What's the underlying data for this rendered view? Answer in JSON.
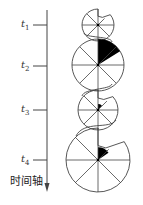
{
  "axis": {
    "title": "时间轴",
    "ticks": [
      {
        "symbol": "t",
        "sub": "1",
        "y": 25
      },
      {
        "symbol": "t",
        "sub": "2",
        "y": 66
      },
      {
        "symbol": "t",
        "sub": "3",
        "y": 110
      },
      {
        "symbol": "t",
        "sub": "4",
        "y": 160
      }
    ]
  },
  "circles": [
    {
      "cx": 98,
      "cy": 25,
      "r": 16,
      "notch_deg": 50,
      "notch_r_frac": 0.55,
      "black_r_frac": 0
    },
    {
      "cx": 98,
      "cy": 65,
      "r": 26,
      "notch_deg": 0,
      "notch_r_frac": 1,
      "black_deg": 58,
      "black_r_frac": 1
    },
    {
      "cx": 98,
      "cy": 110,
      "r": 20,
      "notch_deg": 48,
      "notch_r_frac": 0.6,
      "black_deg": 40,
      "black_r_frac": 0.3
    },
    {
      "cx": 98,
      "cy": 160,
      "r": 32,
      "notch_deg": 55,
      "notch_r_frac": 0.45,
      "black_deg": 55,
      "black_r_frac": 0.4
    }
  ],
  "colors": {
    "line": "#444444",
    "fill": "#000000"
  }
}
